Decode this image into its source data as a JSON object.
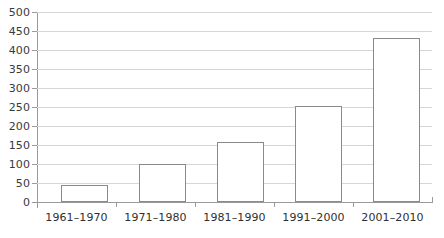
{
  "chart_data": {
    "type": "bar",
    "title": "",
    "subtitle": "",
    "xlabel": "",
    "ylabel": "",
    "categories": [
      "1961–1970",
      "1971–1980",
      "1981–1990",
      "1991–2000",
      "2001–2010"
    ],
    "values": [
      45,
      100,
      158,
      252,
      432
    ],
    "series": [
      {
        "name": "Count",
        "values": [
          45,
          100,
          158,
          252,
          432
        ]
      }
    ],
    "ylim": [
      0,
      500
    ],
    "ytick_values": [
      0,
      50,
      100,
      150,
      200,
      250,
      300,
      350,
      400,
      450,
      500
    ],
    "ytick_labels": [
      "0",
      "50",
      "100",
      "150",
      "200",
      "250",
      "300",
      "350",
      "400",
      "450",
      "500"
    ],
    "grid": "horizontal",
    "legend": "none",
    "bar_fill_color": "#ffffff",
    "bar_border_color": "#8a8a8a",
    "gridline_color": "#d6d6d6",
    "axis_color": "#9a9a9a",
    "text_color": "#2f2f2f"
  }
}
